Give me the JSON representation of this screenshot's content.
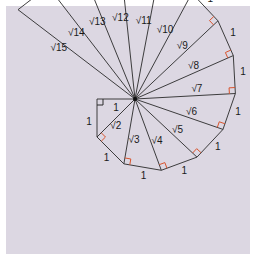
{
  "diagram": {
    "center_label": "",
    "colors": {
      "background": "#dcd7e2",
      "line": "#2a2a2a",
      "right_angle_first": "#2a2a2a",
      "right_angle": "#d9532c"
    },
    "unit_label": "1",
    "hypotenuse_labels": [
      "√2",
      "√3",
      "√4",
      "√5",
      "√6",
      "√7",
      "√8",
      "√9",
      "√10",
      "√11",
      "√12",
      "√13",
      "√14",
      "√15"
    ],
    "triangle_count": 14
  }
}
